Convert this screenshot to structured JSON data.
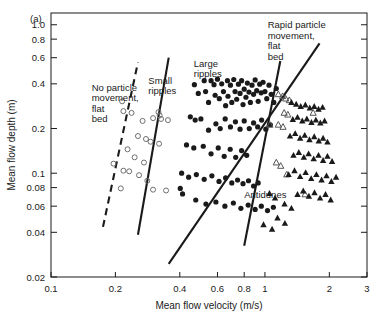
{
  "figure": {
    "panel_label": "(a)",
    "background": "#ffffff",
    "ink": "#1a1a1a"
  },
  "chart_data": {
    "type": "scatter",
    "title": "",
    "xlabel": "Mean flow velocity (m/s)",
    "ylabel": "Mean flow depth (m)",
    "xscale": "log",
    "yscale": "log",
    "xlim": [
      0.1,
      3
    ],
    "ylim": [
      0.02,
      1.2
    ],
    "grid": false,
    "legend_position": "none",
    "xticks": [
      0.1,
      0.2,
      0.4,
      0.6,
      0.8,
      1,
      2,
      3
    ],
    "xticklabels": [
      "0.1",
      "0.2",
      "0.4",
      "0.6",
      "0.8",
      "1",
      "2",
      "3"
    ],
    "yticks": [
      0.02,
      0.04,
      0.06,
      0.08,
      0.1,
      0.2,
      0.4,
      0.6,
      0.8,
      1.0
    ],
    "yticklabels": [
      "0.02",
      "0.04",
      "0.06",
      "0.08",
      "0.1",
      "0.2",
      "0.4",
      "0.6",
      "0.8",
      "1.0"
    ],
    "annotations": [
      {
        "text": "No particle\nmovement,\nflat\nbed",
        "x": 0.155,
        "y": 0.36
      },
      {
        "text": "Small\nripples",
        "x": 0.285,
        "y": 0.4
      },
      {
        "text": "Large\nripples",
        "x": 0.465,
        "y": 0.52
      },
      {
        "text": "Rapid particle\nmovement,\nflat\nbed",
        "x": 1.03,
        "y": 0.95
      },
      {
        "text": "Antidunes",
        "x": 0.8,
        "y": 0.068
      }
    ],
    "boundary_lines": [
      {
        "name": "no-movement-boundary",
        "style": "dashed",
        "x": [
          0.175,
          0.255
        ],
        "y": [
          0.0435,
          0.56
        ]
      },
      {
        "name": "small-large-ripples-boundary",
        "style": "solid",
        "x": [
          0.255,
          0.355
        ],
        "y": [
          0.0385,
          0.6
        ]
      },
      {
        "name": "ripples-antidunes-boundary",
        "style": "solid",
        "x": [
          0.355,
          1.8
        ],
        "y": [
          0.0245,
          0.75
        ]
      },
      {
        "name": "antidunes-rapid-flat-boundary",
        "style": "solid",
        "x": [
          0.8,
          1.18
        ],
        "y": [
          0.0325,
          0.57
        ]
      }
    ],
    "series": [
      {
        "name": "Small ripples",
        "marker": "open-circle",
        "points": [
          [
            0.215,
            0.305
          ],
          [
            0.218,
            0.262
          ],
          [
            0.238,
            0.255
          ],
          [
            0.268,
            0.225
          ],
          [
            0.3,
            0.235
          ],
          [
            0.318,
            0.258
          ],
          [
            0.322,
            0.245
          ],
          [
            0.327,
            0.232
          ],
          [
            0.352,
            0.228
          ],
          [
            0.255,
            0.178
          ],
          [
            0.278,
            0.17
          ],
          [
            0.292,
            0.163
          ],
          [
            0.32,
            0.158
          ],
          [
            0.228,
            0.145
          ],
          [
            0.246,
            0.128
          ],
          [
            0.218,
            0.104
          ],
          [
            0.232,
            0.103
          ],
          [
            0.258,
            0.097
          ],
          [
            0.282,
            0.089
          ],
          [
            0.212,
            0.079
          ],
          [
            0.3,
            0.0775
          ],
          [
            0.345,
            0.0765
          ],
          [
            0.196,
            0.116
          ],
          [
            0.272,
            0.118
          ]
        ]
      },
      {
        "name": "Large ripples and dunes",
        "marker": "filled-circle",
        "points": [
          [
            0.402,
            0.079
          ],
          [
            0.412,
            0.0725
          ],
          [
            0.468,
            0.395
          ],
          [
            0.488,
            0.345
          ],
          [
            0.52,
            0.42
          ],
          [
            0.528,
            0.355
          ],
          [
            0.545,
            0.3
          ],
          [
            0.56,
            0.42
          ],
          [
            0.578,
            0.395
          ],
          [
            0.585,
            0.335
          ],
          [
            0.6,
            0.43
          ],
          [
            0.612,
            0.318
          ],
          [
            0.628,
            0.4
          ],
          [
            0.64,
            0.355
          ],
          [
            0.655,
            0.285
          ],
          [
            0.668,
            0.42
          ],
          [
            0.672,
            0.33
          ],
          [
            0.69,
            0.392
          ],
          [
            0.7,
            0.3
          ],
          [
            0.715,
            0.428
          ],
          [
            0.725,
            0.355
          ],
          [
            0.738,
            0.315
          ],
          [
            0.752,
            0.398
          ],
          [
            0.765,
            0.345
          ],
          [
            0.778,
            0.42
          ],
          [
            0.79,
            0.29
          ],
          [
            0.8,
            0.368
          ],
          [
            0.815,
            0.325
          ],
          [
            0.828,
            0.405
          ],
          [
            0.842,
            0.352
          ],
          [
            0.855,
            0.3
          ],
          [
            0.87,
            0.392
          ],
          [
            0.885,
            0.34
          ],
          [
            0.9,
            0.425
          ],
          [
            0.915,
            0.36
          ],
          [
            0.93,
            0.305
          ],
          [
            0.945,
            0.398
          ],
          [
            0.96,
            0.348
          ],
          [
            0.98,
            0.41
          ],
          [
            1.0,
            0.355
          ],
          [
            1.02,
            0.318
          ],
          [
            1.045,
            0.392
          ],
          [
            1.07,
            0.34
          ],
          [
            1.1,
            0.3
          ],
          [
            1.13,
            0.372
          ],
          [
            0.448,
            0.24
          ],
          [
            0.472,
            0.228
          ],
          [
            0.502,
            0.232
          ],
          [
            0.545,
            0.195
          ],
          [
            0.59,
            0.215
          ],
          [
            0.618,
            0.2
          ],
          [
            0.652,
            0.232
          ],
          [
            0.69,
            0.205
          ],
          [
            0.728,
            0.222
          ],
          [
            0.765,
            0.198
          ],
          [
            0.8,
            0.225
          ],
          [
            0.845,
            0.2
          ],
          [
            0.885,
            0.218
          ],
          [
            0.925,
            0.205
          ],
          [
            0.965,
            0.228
          ],
          [
            1.01,
            0.198
          ],
          [
            1.06,
            0.212
          ],
          [
            0.43,
            0.155
          ],
          [
            0.465,
            0.148
          ],
          [
            0.515,
            0.152
          ],
          [
            0.56,
            0.135
          ],
          [
            0.605,
            0.148
          ],
          [
            0.645,
            0.13
          ],
          [
            0.688,
            0.145
          ],
          [
            0.73,
            0.128
          ],
          [
            0.778,
            0.142
          ],
          [
            0.822,
            0.132
          ],
          [
            0.408,
            0.1
          ],
          [
            0.44,
            0.094
          ],
          [
            0.478,
            0.098
          ],
          [
            0.52,
            0.091
          ],
          [
            0.565,
            0.096
          ],
          [
            0.61,
            0.088
          ],
          [
            0.655,
            0.093
          ],
          [
            0.7,
            0.086
          ],
          [
            0.745,
            0.09
          ],
          [
            0.79,
            0.085
          ],
          [
            0.838,
            0.089
          ],
          [
            0.885,
            0.082
          ],
          [
            0.93,
            0.086
          ],
          [
            0.475,
            0.066
          ],
          [
            0.53,
            0.062
          ],
          [
            0.59,
            0.064
          ],
          [
            0.65,
            0.06
          ],
          [
            0.712,
            0.063
          ],
          [
            0.772,
            0.058
          ],
          [
            0.835,
            0.061
          ],
          [
            0.9,
            0.057
          ],
          [
            0.962,
            0.06
          ],
          [
            1.028,
            0.056
          ],
          [
            1.095,
            0.059
          ]
        ]
      },
      {
        "name": "Transition",
        "marker": "open-triangle",
        "points": [
          [
            1.155,
            0.34
          ],
          [
            1.21,
            0.33
          ],
          [
            1.25,
            0.318
          ],
          [
            1.3,
            0.31
          ],
          [
            1.23,
            0.255
          ],
          [
            1.28,
            0.248
          ],
          [
            1.155,
            0.212
          ],
          [
            1.215,
            0.205
          ],
          [
            1.055,
            0.212
          ],
          [
            1.13,
            0.118
          ],
          [
            1.185,
            0.112
          ],
          [
            1.68,
            0.255
          ],
          [
            1.54,
            0.072
          ],
          [
            1.265,
            0.098
          ]
        ]
      },
      {
        "name": "Upper flat bed and antidunes",
        "marker": "filled-triangle",
        "points": [
          [
            1.33,
            0.3
          ],
          [
            1.4,
            0.292
          ],
          [
            1.47,
            0.282
          ],
          [
            1.545,
            0.288
          ],
          [
            1.62,
            0.275
          ],
          [
            1.7,
            0.282
          ],
          [
            1.78,
            0.27
          ],
          [
            1.86,
            0.278
          ],
          [
            1.35,
            0.23
          ],
          [
            1.42,
            0.238
          ],
          [
            1.495,
            0.225
          ],
          [
            1.57,
            0.232
          ],
          [
            1.65,
            0.22
          ],
          [
            1.73,
            0.228
          ],
          [
            1.815,
            0.218
          ],
          [
            1.9,
            0.225
          ],
          [
            1.31,
            0.178
          ],
          [
            1.385,
            0.185
          ],
          [
            1.46,
            0.172
          ],
          [
            1.535,
            0.18
          ],
          [
            1.615,
            0.168
          ],
          [
            1.7,
            0.176
          ],
          [
            1.785,
            0.165
          ],
          [
            1.87,
            0.172
          ],
          [
            1.96,
            0.162
          ],
          [
            1.36,
            0.132
          ],
          [
            1.44,
            0.138
          ],
          [
            1.52,
            0.128
          ],
          [
            1.6,
            0.135
          ],
          [
            1.69,
            0.125
          ],
          [
            1.78,
            0.132
          ],
          [
            1.87,
            0.122
          ],
          [
            1.96,
            0.13
          ],
          [
            2.06,
            0.12
          ],
          [
            1.29,
            0.098
          ],
          [
            1.375,
            0.104
          ],
          [
            1.46,
            0.095
          ],
          [
            1.55,
            0.101
          ],
          [
            1.645,
            0.092
          ],
          [
            1.74,
            0.098
          ],
          [
            1.84,
            0.09
          ],
          [
            1.94,
            0.096
          ],
          [
            2.045,
            0.088
          ],
          [
            2.15,
            0.094
          ],
          [
            1.42,
            0.072
          ],
          [
            1.51,
            0.076
          ],
          [
            1.605,
            0.07
          ],
          [
            1.705,
            0.074
          ],
          [
            1.81,
            0.068
          ],
          [
            1.92,
            0.072
          ],
          [
            2.03,
            0.066
          ],
          [
            1.235,
            0.062
          ],
          [
            1.33,
            0.058
          ],
          [
            1.145,
            0.05
          ],
          [
            1.24,
            0.046
          ],
          [
            1.05,
            0.073
          ],
          [
            1.115,
            0.068
          ],
          [
            0.985,
            0.045
          ],
          [
            1.08,
            0.042
          ]
        ]
      }
    ]
  }
}
